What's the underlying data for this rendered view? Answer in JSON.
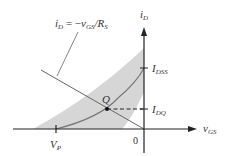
{
  "diagram": {
    "equation_label": {
      "lhs_main": "i",
      "lhs_sub": "D",
      "equals": " = −",
      "v_main": "v",
      "v_sub": "GS",
      "slash": "/",
      "r_main": "R",
      "r_sub": "S"
    },
    "axes": {
      "y_label_main": "i",
      "y_label_sub": "D",
      "x_label_main": "v",
      "x_label_sub": "GS",
      "origin_label": "0"
    },
    "ticks": {
      "idss_main": "I",
      "idss_sub": "DSS",
      "idq_main": "I",
      "idq_sub": "DQ",
      "vp_main": "V",
      "vp_sub": "P"
    },
    "q_point_label": "Q",
    "colors": {
      "axis": "#222222",
      "curve": "#777777",
      "band": "#d6d6d6",
      "load_line": "#666666",
      "text": "#333333"
    }
  }
}
